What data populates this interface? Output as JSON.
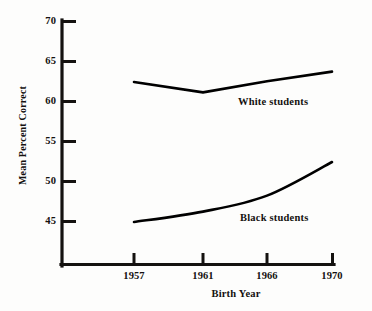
{
  "chart_data": {
    "type": "line",
    "title": "",
    "subtitle": "",
    "xlabel": "Birth Year",
    "ylabel": "Mean Percent Correct",
    "x": [
      1957,
      1961,
      1966,
      1970
    ],
    "categories": [
      "1957",
      "1961",
      "1966",
      "1970"
    ],
    "xtick_labels": [
      "1957",
      "1961",
      "1966",
      "1970"
    ],
    "ytick_labels": [
      "45",
      "50",
      "55",
      "60",
      "65",
      "70"
    ],
    "ytick_values": [
      45,
      50,
      55,
      60,
      65,
      70
    ],
    "xlim": [
      1957,
      1970
    ],
    "ylim": [
      45,
      70
    ],
    "grid": false,
    "legend_position": "inline-annotation",
    "series": [
      {
        "name": "White students",
        "label": "White students",
        "values": [
          62.5,
          61.2,
          62.6,
          63.8
        ],
        "color": "#000000"
      },
      {
        "name": "Black students",
        "label": "Black students",
        "values": [
          45.0,
          46.3,
          48.3,
          52.5
        ],
        "color": "#000000"
      }
    ],
    "annotations": [
      {
        "text": "White students",
        "series": "White students"
      },
      {
        "text": "Black students",
        "series": "Black students"
      }
    ]
  },
  "axes": {
    "y_axis_title": "Mean Percent Correct",
    "x_axis_title": "Birth Year",
    "line_color": "#141210",
    "tick_color": "#141210"
  }
}
